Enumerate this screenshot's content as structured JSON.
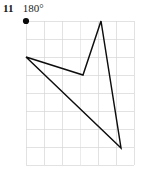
{
  "exercise": {
    "number": "11",
    "answer": "180°"
  },
  "figure": {
    "center_of_rotation_label": "center-of-rotation-dot",
    "grid": {
      "left": 26,
      "top": 21,
      "right": 134,
      "bottom": 165,
      "cell_size": 18,
      "columns": 6,
      "rows": 8,
      "line_color": "#d6d6d6"
    },
    "shape": {
      "name": "dart-quadrilateral",
      "stroke_color": "#0d0d0d",
      "fill": "none",
      "vertices": [
        {
          "label": "left-point",
          "x": 26,
          "y": 57
        },
        {
          "label": "inner-notch",
          "x": 83,
          "y": 75
        },
        {
          "label": "top-apex",
          "x": 101,
          "y": 21
        },
        {
          "label": "bottom-point",
          "x": 121,
          "y": 148
        }
      ],
      "points_string": "26,57 83,75 101,21 121,148"
    },
    "center_dot": {
      "x": 26,
      "y": 21,
      "radius": 3.1,
      "color": "#0a0a0a"
    }
  }
}
